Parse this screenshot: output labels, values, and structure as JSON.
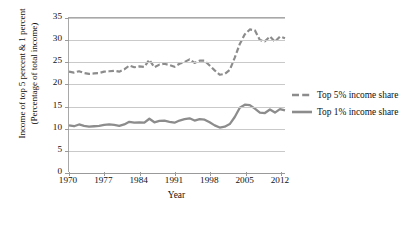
{
  "chart_data": {
    "type": "line",
    "title": "",
    "xlabel": "Year",
    "ylabel_line1": "Income of top 5 percent & 1 percent",
    "ylabel_line2": "(Percentage of total income)",
    "xlim": [
      1970,
      2013
    ],
    "ylim": [
      0,
      35
    ],
    "yticks": [
      0,
      5,
      10,
      15,
      20,
      25,
      30,
      35
    ],
    "xticks": [
      1970,
      1977,
      1984,
      1991,
      1998,
      2005,
      2012
    ],
    "grid": "horizontal",
    "legend_position": "right",
    "x": [
      1970,
      1971,
      1972,
      1973,
      1974,
      1975,
      1976,
      1977,
      1978,
      1979,
      1980,
      1981,
      1982,
      1983,
      1984,
      1985,
      1986,
      1987,
      1988,
      1989,
      1990,
      1991,
      1992,
      1993,
      1994,
      1995,
      1996,
      1997,
      1998,
      1999,
      2000,
      2001,
      2002,
      2003,
      2004,
      2005,
      2006,
      2007,
      2008,
      2009,
      2010,
      2011,
      2012,
      2013
    ],
    "series": [
      {
        "name": "Top 5% income share",
        "style": "dashed",
        "color": "#8c8c8c",
        "values": [
          22.8,
          22.6,
          22.9,
          22.5,
          22.3,
          22.4,
          22.5,
          22.8,
          22.9,
          23.0,
          22.8,
          23.3,
          24.2,
          23.8,
          24.0,
          23.9,
          25.5,
          23.8,
          24.4,
          24.6,
          24.3,
          23.9,
          24.6,
          25.0,
          25.6,
          24.8,
          25.3,
          25.3,
          24.2,
          23.1,
          22.1,
          22.3,
          23.2,
          26.0,
          29.1,
          31.3,
          32.4,
          32.2,
          30.0,
          29.7,
          30.8,
          29.6,
          30.8,
          30.4
        ]
      },
      {
        "name": "Top 1% income share",
        "style": "solid",
        "color": "#8c8c8c",
        "values": [
          10.6,
          10.4,
          10.8,
          10.5,
          10.3,
          10.4,
          10.5,
          10.7,
          10.8,
          10.7,
          10.5,
          10.8,
          11.4,
          11.2,
          11.3,
          11.2,
          12.1,
          11.3,
          11.6,
          11.7,
          11.4,
          11.2,
          11.7,
          12.0,
          12.2,
          11.7,
          12.0,
          11.9,
          11.3,
          10.6,
          10.1,
          10.3,
          10.9,
          12.5,
          14.6,
          15.3,
          15.2,
          14.4,
          13.5,
          13.4,
          14.2,
          13.5,
          14.3,
          14.0
        ]
      }
    ]
  },
  "axis": {
    "x_title": "Year",
    "y_title_line1": "Income of top 5 percent & 1 percent",
    "y_title_line2": "(Percentage of total income)"
  },
  "legend": {
    "items": [
      {
        "label": "Top 5% income share"
      },
      {
        "label": "Top 1% income share"
      }
    ]
  }
}
